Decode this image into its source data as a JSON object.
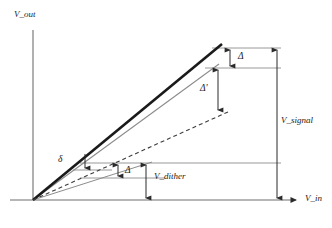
{
  "figure": {
    "type": "transfer-function-diagram",
    "background": "#ffffff",
    "ink_color": "#1a1a1a",
    "gray_color": "#8c8c8c"
  },
  "axes": {
    "y_label": "V_out",
    "x_label": "V_in",
    "origin": {
      "x": 33,
      "y": 200
    },
    "y_top": {
      "x": 33,
      "y": 28
    },
    "x_right": {
      "x": 300,
      "y": 200
    }
  },
  "curves": [
    {
      "name": "ideal-thick-line",
      "style": "solid-thick",
      "color": "#1a1a1a",
      "from": {
        "x": 33,
        "y": 200
      },
      "to": {
        "x": 222,
        "y": 44
      }
    },
    {
      "name": "dithered-thin-line",
      "style": "solid-thin",
      "color": "#8c8c8c",
      "from": {
        "x": 33,
        "y": 200
      },
      "to": {
        "x": 219,
        "y": 64
      }
    },
    {
      "name": "shallow-gray-line",
      "style": "solid-thin",
      "color": "#8c8c8c",
      "from": {
        "x": 33,
        "y": 200
      },
      "to": {
        "x": 150,
        "y": 163
      }
    },
    {
      "name": "dashed-response-line",
      "style": "dashed",
      "color": "#4d4d4d",
      "from": {
        "x": 33,
        "y": 200
      },
      "to": {
        "x": 228,
        "y": 112
      }
    }
  ],
  "annotations": {
    "delta_upper": "Δ",
    "delta_prime": "Δ'",
    "delta_lower": "Δ",
    "delta_small": "δ",
    "v_signal": "V_signal",
    "v_dither": "V_dither"
  },
  "reference_lines": [
    {
      "name": "top-upper-hline",
      "x1": 212,
      "y1": 48,
      "x2": 281,
      "y2": 48
    },
    {
      "name": "top-lower-hline",
      "x1": 212,
      "y1": 68,
      "x2": 281,
      "y2": 68
    },
    {
      "name": "low-upper-hline",
      "x1": 80,
      "y1": 163,
      "x2": 281,
      "y2": 163
    },
    {
      "name": "low-lower-hline",
      "x1": 80,
      "y1": 178,
      "x2": 165,
      "y2": 178
    },
    {
      "name": "delta-small-hline",
      "x1": 73,
      "y1": 170,
      "x2": 110,
      "y2": 170
    }
  ],
  "measure_arrows": [
    {
      "name": "delta-upper-arrow",
      "x": 230,
      "y1": 48,
      "y2": 68,
      "heads": "both"
    },
    {
      "name": "delta-prime-arrow",
      "x": 218,
      "y1": 68,
      "y2": 112,
      "heads": "both"
    },
    {
      "name": "v-signal-arrow",
      "x": 277,
      "y1": 48,
      "y2": 200,
      "heads": "both"
    },
    {
      "name": "v-dither-arrow",
      "x": 146,
      "y1": 163,
      "y2": 200,
      "heads": "both"
    },
    {
      "name": "delta-lower-arrow",
      "x": 118,
      "y1": 163,
      "y2": 178,
      "heads": "both"
    },
    {
      "name": "delta-small-arrow",
      "x": 85,
      "y1": 155,
      "y2": 170,
      "heads": "down"
    }
  ]
}
